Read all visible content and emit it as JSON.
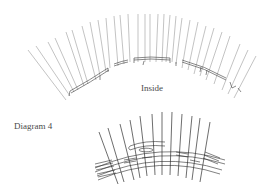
{
  "figure": {
    "top_diagram": {
      "label": "Inside",
      "description": "Arc of radiating stakes with a curved rail segment woven on the inside"
    },
    "bottom_diagram": {
      "label": "Diagram 4",
      "description": "Close-up of woven band around radiating stakes"
    }
  },
  "colors": {
    "background": "#ffffff",
    "line": "#3a3a3a",
    "light_line": "#8a8a8a",
    "text": "#4a4a4a"
  }
}
